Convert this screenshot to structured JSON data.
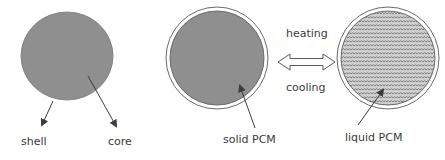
{
  "labels": {
    "shell": "shell",
    "core": "core",
    "solid": "solid PCM",
    "liquid": "liquid PCM",
    "heating": "heating",
    "cooling": "cooling"
  },
  "colors": {
    "fill": "#8f8f8f",
    "stroke": "#5a5a5a",
    "arrow": "#3c3c3c",
    "ring": "#ffffff"
  }
}
